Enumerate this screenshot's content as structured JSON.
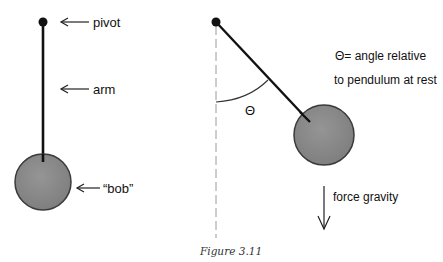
{
  "diagram": {
    "left_pendulum": {
      "labels": {
        "pivot": "pivot",
        "arm": "arm",
        "bob": "“bob”"
      }
    },
    "right_pendulum": {
      "angle_symbol": "Θ",
      "legend_line1": "Θ= angle relative",
      "legend_line2": "to pendulum at rest",
      "gravity_label": "force gravity"
    },
    "caption": "Figure 3.11",
    "colors": {
      "bob_fill": "#8a8a8a",
      "bob_stroke": "#3a3a3a",
      "line": "#111111",
      "dashed": "#9a9a9a"
    }
  }
}
